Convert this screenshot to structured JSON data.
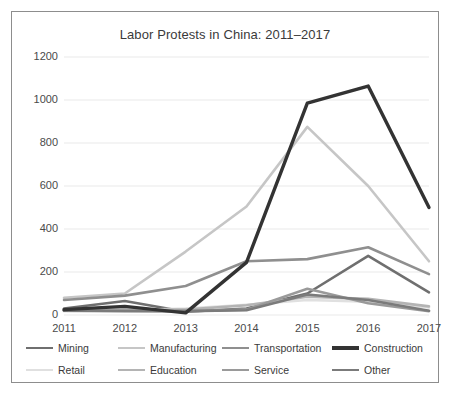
{
  "chart_data": {
    "type": "line",
    "title": "Labor Protests in China: 2011–2017",
    "xlabel": "",
    "ylabel": "",
    "categories": [
      "2011",
      "2012",
      "2013",
      "2014",
      "2015",
      "2016",
      "2017"
    ],
    "x": [
      2011,
      2012,
      2013,
      2014,
      2015,
      2016,
      2017
    ],
    "ylim": [
      0,
      1200
    ],
    "yticks": [
      0,
      200,
      400,
      600,
      800,
      1000,
      1200
    ],
    "grid": true,
    "legend_position": "bottom",
    "series": [
      {
        "name": "Mining",
        "color": "#6f6f6f",
        "width": 2.6,
        "values": [
          30,
          65,
          15,
          30,
          100,
          275,
          105
        ]
      },
      {
        "name": "Manufacturing",
        "color": "#c6c6c6",
        "width": 2.6,
        "values": [
          80,
          100,
          295,
          505,
          875,
          600,
          250
        ]
      },
      {
        "name": "Transportation",
        "color": "#8f8f8f",
        "width": 2.6,
        "values": [
          70,
          90,
          135,
          250,
          260,
          315,
          190
        ]
      },
      {
        "name": "Construction",
        "color": "#333333",
        "width": 3.4,
        "values": [
          25,
          40,
          10,
          245,
          985,
          1065,
          500
        ]
      },
      {
        "name": "Retail",
        "color": "#e0e0e0",
        "width": 2.6,
        "values": [
          18,
          22,
          30,
          48,
          70,
          62,
          35
        ]
      },
      {
        "name": "Education",
        "color": "#b4b4b4",
        "width": 2.6,
        "values": [
          22,
          25,
          25,
          45,
          85,
          75,
          40
        ]
      },
      {
        "name": "Service",
        "color": "#9a9a9a",
        "width": 2.6,
        "values": [
          20,
          20,
          18,
          25,
          122,
          55,
          18
        ]
      },
      {
        "name": "Other",
        "color": "#7b7b7b",
        "width": 2.6,
        "values": [
          20,
          18,
          18,
          22,
          95,
          70,
          20
        ]
      }
    ]
  },
  "legend": {
    "rows": [
      [
        "Mining",
        "Manufacturing",
        "Transportation",
        "Construction"
      ],
      [
        "Retail",
        "Education",
        "Service",
        "Other"
      ]
    ]
  },
  "colors": {
    "frame_border": "#8d8d8d",
    "gridline": "#e9e9e9",
    "axis_text": "#4a4a4a",
    "title_text": "#3a3a3a",
    "background": "#ffffff"
  }
}
